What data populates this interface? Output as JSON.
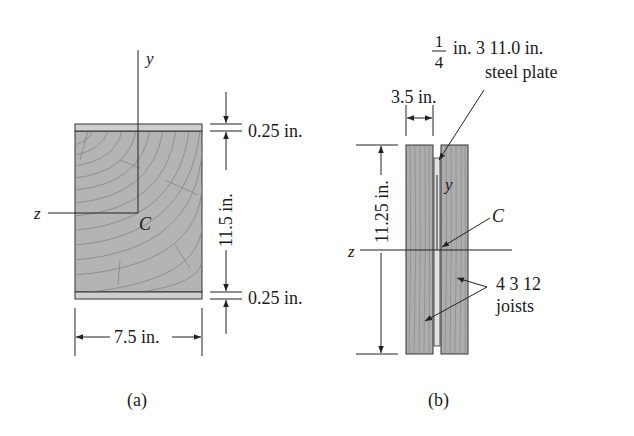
{
  "figure_a": {
    "caption": "(a)",
    "axis_y": "y",
    "axis_z": "z",
    "centroid": "C",
    "dim_top_plate": "0.25 in.",
    "dim_height": "11.5 in.",
    "dim_bottom_plate": "0.25 in.",
    "dim_width": "7.5 in."
  },
  "figure_b": {
    "caption": "(b)",
    "axis_y": "y",
    "axis_z": "z",
    "centroid": "C",
    "plate_fraction_num": "1",
    "plate_fraction_den": "4",
    "plate_label_line1": "in. 3 11.0 in.",
    "plate_label_line2": "steel plate",
    "dim_joist_width": "3.5 in.",
    "dim_height": "11.25 in.",
    "joist_label_line1": "4 3 12",
    "joist_label_line2": "joists"
  },
  "colors": {
    "wood": "#b4b4b4",
    "plate": "#cfcfcf",
    "line": "#2a2a2a",
    "grain": "#8c8c8c"
  }
}
